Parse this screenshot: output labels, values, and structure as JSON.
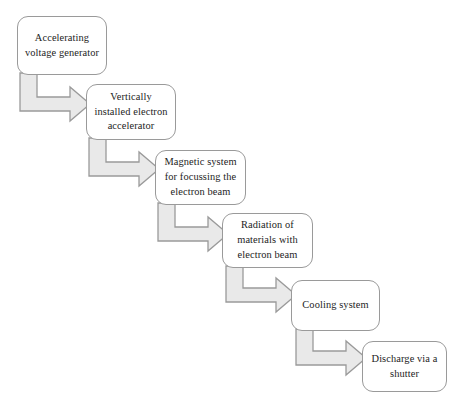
{
  "diagram": {
    "background_color": "#ffffff",
    "node_fill": "#ffffff",
    "node_border_color": "#9a9a9a",
    "arrow_fill": "#e9e9e9",
    "arrow_border_color": "#9a9a9a",
    "text_color": "#1d1d1d",
    "nodes": [
      {
        "id": "accelerating-voltage-generator",
        "label": "Accelerating voltage generator",
        "x": 17,
        "y": 16,
        "width": 90,
        "height": 59
      },
      {
        "id": "vertically-installed-electron-accelerator",
        "label": "Vertically installed electron accelerator",
        "x": 86,
        "y": 84,
        "width": 90,
        "height": 56
      },
      {
        "id": "magnetic-system-for-focussing-the-electron-beam",
        "label": "Magnetic system for focussing the electron beam",
        "x": 155,
        "y": 150,
        "width": 91,
        "height": 55
      },
      {
        "id": "radiation-of-materials-with-electron-beam",
        "label": "Radiation of materials with electron beam",
        "x": 222,
        "y": 213,
        "width": 91,
        "height": 55
      },
      {
        "id": "cooling-system",
        "label": "Cooling system",
        "x": 291,
        "y": 280,
        "width": 89,
        "height": 51
      },
      {
        "id": "discharge-via-a-shutter",
        "label": "Discharge via a shutter",
        "x": 362,
        "y": 341,
        "width": 85,
        "height": 51
      }
    ],
    "connectors": [
      {
        "id": "connector-1",
        "from": "accelerating-voltage-generator",
        "to": "vertically-installed-electron-accelerator"
      },
      {
        "id": "connector-2",
        "from": "vertically-installed-electron-accelerator",
        "to": "magnetic-system-for-focussing-the-electron-beam"
      },
      {
        "id": "connector-3",
        "from": "magnetic-system-for-focussing-the-electron-beam",
        "to": "radiation-of-materials-with-electron-beam"
      },
      {
        "id": "connector-4",
        "from": "radiation-of-materials-with-electron-beam",
        "to": "cooling-system"
      },
      {
        "id": "connector-5",
        "from": "cooling-system",
        "to": "discharge-via-a-shutter"
      }
    ]
  }
}
